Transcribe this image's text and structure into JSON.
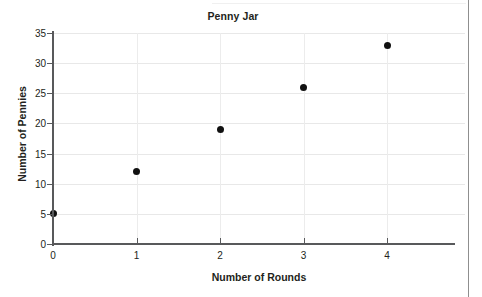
{
  "chart_data": {
    "type": "scatter",
    "title": "Penny Jar",
    "xlabel": "Number of Rounds",
    "ylabel": "Number of Pennies",
    "x": [
      0,
      1,
      2,
      3,
      4
    ],
    "values": [
      5,
      12,
      19,
      26,
      33
    ],
    "series": [
      {
        "name": "Penny Jar",
        "points": [
          {
            "x": 0,
            "y": 5
          },
          {
            "x": 1,
            "y": 12
          },
          {
            "x": 2,
            "y": 19
          },
          {
            "x": 3,
            "y": 26
          },
          {
            "x": 4,
            "y": 33
          }
        ]
      }
    ],
    "xlim": [
      0,
      4.9
    ],
    "ylim": [
      0,
      35
    ],
    "xticks": [
      "0",
      "1",
      "2",
      "3",
      "4"
    ],
    "yticks": [
      "0",
      "5",
      "10",
      "15",
      "20",
      "25",
      "30",
      "35"
    ],
    "grid": "horizontal-and-vertical",
    "legend": "none",
    "marker_color": "#111111",
    "grid_color": "#e8e8e8",
    "axis_color": "#58595b",
    "text_color": "#231f20"
  }
}
